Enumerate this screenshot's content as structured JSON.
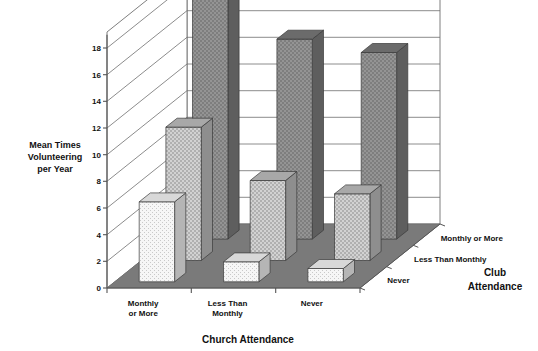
{
  "chart_data": {
    "type": "bar",
    "title": "",
    "subtitle": "",
    "projection": "3d",
    "xlabel": "Church Attendance",
    "zlabel": "Club Attendance",
    "ylabel": "Mean Times Volunteering per Year",
    "ylabel_lines": [
      "Mean Times",
      "Volunteering",
      "per Year"
    ],
    "ylim": [
      0,
      18
    ],
    "ytick_step": 2,
    "yticks": [
      0,
      2,
      4,
      6,
      8,
      10,
      12,
      14,
      16,
      18
    ],
    "ytick_labels": [
      "0",
      "2",
      "4",
      "6",
      "8",
      "10",
      "12",
      "14",
      "16",
      "18"
    ],
    "grid": true,
    "legend_position": "depth-axis",
    "categories": [
      "Monthly or More",
      "Less Than Monthly",
      "Never"
    ],
    "category_lines": [
      [
        "Monthly",
        "or More"
      ],
      [
        "Less Than",
        "Monthly"
      ],
      [
        "Never"
      ]
    ],
    "depth_categories": [
      "Monthly or More",
      "Less Than Monthly",
      "Never"
    ],
    "series": [
      {
        "name": "Monthly or More",
        "row": "back",
        "values": [
          18.5,
          15.0,
          14.0
        ],
        "fill": "#8c8c8c"
      },
      {
        "name": "Less Than Monthly",
        "row": "middle",
        "values": [
          10.0,
          6.0,
          5.0
        ],
        "fill": "#c4c4c4"
      },
      {
        "name": "Never",
        "row": "front",
        "values": [
          6.0,
          1.5,
          1.0
        ],
        "fill": "#f2f2f2"
      }
    ]
  },
  "axis": {
    "x_title": "Church Attendance",
    "z_title_lines": [
      "Club",
      "Attendance"
    ],
    "y_title_lines": [
      "Mean Times",
      "Volunteering",
      "per Year"
    ]
  },
  "colors": {
    "floor": "#7a7a7a",
    "wall": "#ffffff",
    "grid": "#6f6f6f",
    "axis": "#555555",
    "bar_back_front": "#8c8c8c",
    "bar_back_side": "#5e5e5e",
    "bar_back_top": "#6b6b6b",
    "bar_mid_front": "#c4c4c4",
    "bar_mid_side": "#8e8e8e",
    "bar_mid_top": "#a8a8a8",
    "bar_front_front": "#f4f4f4",
    "bar_front_side": "#b5b5b5",
    "bar_front_top": "#d8d8d8",
    "text": "#111111"
  }
}
